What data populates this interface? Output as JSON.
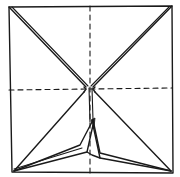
{
  "diagram": {
    "ink_color": "#1a1a1a",
    "background_color": "#ffffff",
    "square": {
      "tl": [
        9,
        7
      ],
      "tr": [
        172,
        6
      ],
      "br": [
        173,
        173
      ],
      "bl": [
        12,
        172
      ]
    },
    "center": [
      90,
      88
    ],
    "dashed_lines": [
      {
        "name": "vertical-midline",
        "from": [
          90,
          6
        ],
        "to": [
          90,
          173
        ]
      },
      {
        "name": "horizontal-midline",
        "from": [
          9,
          90
        ],
        "to": [
          172,
          88
        ]
      }
    ],
    "double_diagonals": [
      {
        "name": "top-left-diagonal",
        "from": [
          9,
          7
        ],
        "to": [
          86,
          88
        ]
      },
      {
        "name": "top-right-diagonal",
        "from": [
          172,
          6
        ],
        "to": [
          93,
          88
        ]
      }
    ],
    "lower_lines": [
      {
        "name": "center-to-bottom-left",
        "from": [
          84,
          90
        ],
        "to": [
          14,
          171
        ]
      },
      {
        "name": "center-to-bottom-right",
        "from": [
          94,
          90
        ],
        "to": [
          171,
          171
        ]
      }
    ],
    "flap": {
      "tip": [
        93,
        120
      ],
      "left_edge_points": [
        [
          14,
          171
        ],
        [
          80,
          145
        ],
        [
          93,
          120
        ]
      ],
      "inner_left_points": [
        [
          14,
          171
        ],
        [
          87,
          152
        ],
        [
          93,
          125
        ]
      ],
      "right_edge_points": [
        [
          93,
          120
        ],
        [
          100,
          153
        ],
        [
          171,
          171
        ]
      ],
      "inner_right_points": [
        [
          93,
          125
        ],
        [
          100,
          158
        ],
        [
          171,
          171
        ]
      ]
    },
    "labels": []
  }
}
